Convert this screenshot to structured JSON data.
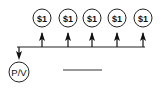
{
  "diagram": {
    "type": "annuity-timeline",
    "cash_flows": [
      {
        "label": "$1"
      },
      {
        "label": "$1"
      },
      {
        "label": "$1"
      },
      {
        "label": "$1"
      },
      {
        "label": "$1"
      }
    ],
    "present_value": {
      "label": "P/V"
    },
    "answer_blank": ""
  }
}
